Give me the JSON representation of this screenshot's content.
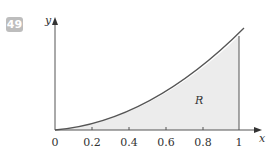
{
  "problem_number": "49",
  "region_label": "R",
  "axes": {
    "x_label": "x",
    "y_label": "y"
  },
  "x_ticks": [
    "0",
    "0.2",
    "0.4",
    "0.6",
    "0.8",
    "1"
  ],
  "colors": {
    "badge": "#bdbdbd",
    "fill": "#ececec",
    "line": "#555555"
  }
}
